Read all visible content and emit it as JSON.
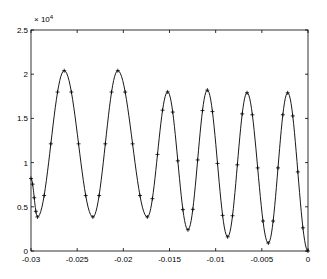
{
  "chart_data": {
    "type": "line",
    "title": "",
    "xlabel": "",
    "ylabel": "",
    "y_multiplier_label": "× 10^4",
    "xlim": [
      -0.03,
      0
    ],
    "ylim": [
      0,
      2.5
    ],
    "y_scale": 10000,
    "grid": false,
    "legend": null,
    "x_ticks": [
      -0.03,
      -0.025,
      -0.02,
      -0.015,
      -0.01,
      -0.005,
      0
    ],
    "x_tick_labels": [
      "-0.03",
      "-0.025",
      "-0.02",
      "-0.015",
      "-0.01",
      "-0.005",
      "0"
    ],
    "y_ticks": [
      0,
      0.5,
      1,
      1.5,
      2,
      2.5
    ],
    "y_tick_labels": [
      "0",
      "0.5",
      "1",
      "1.5",
      "2",
      "2.5"
    ],
    "series": [
      {
        "name": "fit",
        "style": "solid line",
        "color": "#000000",
        "extrema": [
          {
            "x": -0.03,
            "y": 0.82
          },
          {
            "x": -0.0293,
            "y": 0.385
          },
          {
            "x": -0.0264,
            "y": 2.04
          },
          {
            "x": -0.0233,
            "y": 0.385
          },
          {
            "x": -0.0206,
            "y": 2.04
          },
          {
            "x": -0.0174,
            "y": 0.385
          },
          {
            "x": -0.0152,
            "y": 1.8
          },
          {
            "x": -0.013,
            "y": 0.24
          },
          {
            "x": -0.0109,
            "y": 1.82
          },
          {
            "x": -0.0087,
            "y": 0.16
          },
          {
            "x": -0.0066,
            "y": 1.79
          },
          {
            "x": -0.0043,
            "y": 0.09
          },
          {
            "x": -0.0022,
            "y": 1.79
          },
          {
            "x": 0.0,
            "y": 0.0
          }
        ]
      },
      {
        "name": "samples",
        "style": "plus markers",
        "color": "#000000",
        "marker": "+"
      }
    ]
  }
}
